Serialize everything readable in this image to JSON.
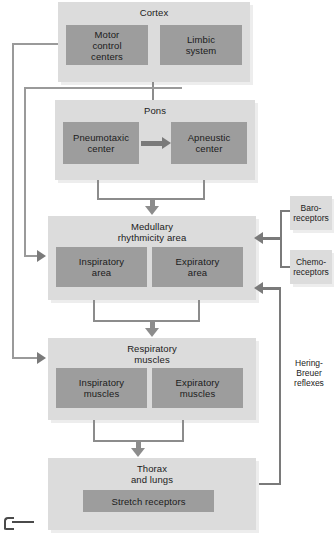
{
  "diagram": {
    "colors": {
      "panel": "#dcdcdc",
      "box": "#9d9d9d",
      "connector": "#8c8c8c",
      "connector_dark": "#7a7a7a",
      "text": "#1b1b1b",
      "background": "#ffffff"
    },
    "nodes": {
      "cortex": {
        "title": "Cortex",
        "boxes": [
          {
            "label": "Motor\ncontrol\ncenters"
          },
          {
            "label": "Limbic\nsystem"
          }
        ]
      },
      "pons": {
        "title": "Pons",
        "boxes": [
          {
            "label": "Pneumotaxic\ncenter"
          },
          {
            "label": "Apneustic\ncenter"
          }
        ]
      },
      "medulla": {
        "title": "Medullary\nrhythmicity area",
        "boxes": [
          {
            "label": "Inspiratory\narea"
          },
          {
            "label": "Expiratory\narea"
          }
        ]
      },
      "muscles": {
        "title": "Respiratory\nmuscles",
        "boxes": [
          {
            "label": "Inspiratory\nmuscles"
          },
          {
            "label": "Expiratory\nmuscles"
          }
        ]
      },
      "thorax": {
        "title": "Thorax\nand lungs",
        "boxes": [
          {
            "label": "Stretch receptors"
          }
        ]
      }
    },
    "side_nodes": {
      "baroreceptors": {
        "label": "Baro-\nreceptors"
      },
      "chemoreceptors": {
        "label": "Chemo-\nreceptors"
      }
    },
    "annotations": {
      "hering_breuer": "Hering-\nBreuer\nreflexes"
    }
  }
}
